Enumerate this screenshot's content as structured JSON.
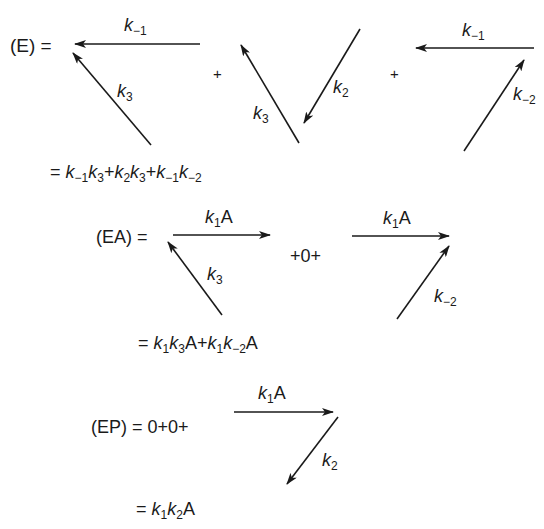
{
  "figure": {
    "stroke_color": "#1a1a1a",
    "background": "#ffffff"
  },
  "E": {
    "lhs": "(E) =",
    "plus_1": "+",
    "plus_2": "+",
    "patterns": [
      {
        "arrows": [
          {
            "label_k": "k",
            "label_sub": "−1",
            "from": [
              200,
              44
            ],
            "to": [
              75,
              44
            ]
          },
          {
            "label_k": "k",
            "label_sub": "3",
            "from": [
              151,
              145
            ],
            "to": [
              73,
              53
            ]
          }
        ]
      },
      {
        "arrows": [
          {
            "label_k": "k",
            "label_sub": "3",
            "from": [
              299,
              143
            ],
            "to": [
              241,
              45
            ]
          },
          {
            "label_k": "k",
            "label_sub": "2",
            "from": [
              360,
              29
            ],
            "to": [
              304,
              123
            ]
          }
        ]
      },
      {
        "arrows": [
          {
            "label_k": "k",
            "label_sub": "−1",
            "from": [
              534,
              48
            ],
            "to": [
              416,
              48
            ]
          },
          {
            "label_k": "k",
            "label_sub": "−2",
            "from": [
              464,
              151
            ],
            "to": [
              524,
              60
            ]
          }
        ]
      }
    ],
    "result": "= k−1k3 + k2k3 + k−1k−2"
  },
  "EA": {
    "lhs": "(EA) =",
    "middle": "+0+",
    "patterns": [
      {
        "arrows": [
          {
            "label": "k1A",
            "from": [
              173,
              235
            ],
            "to": [
              270,
              235
            ]
          },
          {
            "label_k": "k",
            "label_sub": "3",
            "from": [
              222,
              315
            ],
            "to": [
              168,
              242
            ]
          }
        ]
      },
      {
        "arrows": [
          {
            "label": "k1A",
            "from": [
              352,
              236
            ],
            "to": [
              449,
              236
            ]
          },
          {
            "label_k": "k",
            "label_sub": "−2",
            "from": [
              397,
              319
            ],
            "to": [
              449,
              246
            ]
          }
        ]
      }
    ],
    "result": "= k1k3A + k1k−2A"
  },
  "EP": {
    "lhs": "(EP) = 0+0+",
    "patterns": [
      {
        "arrows": [
          {
            "label": "k1A",
            "from": [
              234,
              412
            ],
            "to": [
              333,
              412
            ]
          },
          {
            "label_k": "k",
            "label_sub": "2",
            "from": [
              338,
              417
            ],
            "to": [
              287,
              484
            ]
          }
        ]
      }
    ],
    "result": "= k1k2A"
  },
  "tokens": {
    "eq": "=",
    "plus": "+",
    "k": "k",
    "A": "A",
    "s_m1": "−1",
    "s_m2": "−2",
    "s_1": "1",
    "s_2": "2",
    "s_3": "3"
  }
}
